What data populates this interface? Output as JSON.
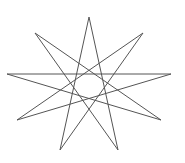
{
  "figure": {
    "shape": "nine-pointed star polygram {9/4}",
    "stroke_color": "#555555",
    "stroke_width": 1,
    "fill": "none",
    "background": "#ffffff",
    "vertices": [
      [
        89,
        17
      ],
      [
        143,
        33
      ],
      [
        171,
        74
      ],
      [
        161,
        120
      ],
      [
        118,
        150
      ],
      [
        60,
        150
      ],
      [
        17,
        120
      ],
      [
        7,
        74
      ],
      [
        35,
        33
      ]
    ],
    "step": 4
  }
}
